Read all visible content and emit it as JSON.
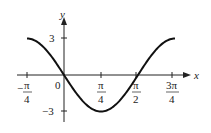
{
  "chart_data": {
    "type": "line",
    "title": "",
    "function": "y = -3 sin(2x)",
    "xlabel": "x",
    "ylabel": "y",
    "xlim": [
      -0.785,
      2.356
    ],
    "ylim": [
      -3,
      3
    ],
    "x_ticks": [
      "-π/4",
      "0",
      "π/4",
      "π/2",
      "3π/4"
    ],
    "y_ticks": [
      "3",
      "-3"
    ],
    "origin_label": "0",
    "series": [
      {
        "name": "curve",
        "x": [
          -0.785,
          0,
          0.785,
          1.571,
          2.356
        ],
        "values": [
          3,
          0,
          -3,
          0,
          3
        ]
      }
    ],
    "grid": false,
    "legend": null
  },
  "labels": {
    "x_axis": "x",
    "y_axis": "y",
    "origin": "0",
    "y_top": "3",
    "y_bottom": "−3",
    "pi": "π",
    "four": "4",
    "two": "2",
    "three_pi": "3π",
    "minus": "−"
  }
}
